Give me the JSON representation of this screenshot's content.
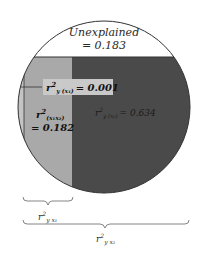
{
  "diagram": {
    "type": "variance-partition-circle",
    "colors": {
      "background": "#ffffff",
      "unexplained": "#ffffff",
      "x1_unique_band": "#a9a9a9",
      "x1_edge_strip": "#c4c4c4",
      "x2_region": "#4a4a4a",
      "label_box": "#c9c9c9",
      "outline": "#333333"
    },
    "regions": {
      "unexplained": {
        "line1": "Unexplained",
        "line2": "= 0.183",
        "value": 0.183
      },
      "x1_given_x2": {
        "r": "r",
        "sup": "2",
        "sub": "y (x₁)",
        "eq": "= 0.001",
        "value": 0.001
      },
      "x1_x2_shared": {
        "r": "r",
        "sup": "2",
        "sub": "(x₁x₂)",
        "eq": "= 0.182",
        "value": 0.182
      },
      "x2_given_x1": {
        "r": "r",
        "sup": "2",
        "sub": "y (x₂)",
        "eq": "= 0.634",
        "value": 0.634
      }
    },
    "braces": {
      "r2_yx1": {
        "r": "r",
        "sup": "2",
        "sub": "y x₁"
      },
      "r2_yx2": {
        "r": "r",
        "sup": "2",
        "sub": "y x₂"
      }
    }
  }
}
